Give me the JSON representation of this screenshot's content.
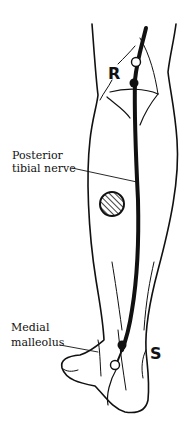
{
  "diagram": {
    "labels": {
      "nerve_line1": "Posterior",
      "nerve_line2": "tibial nerve",
      "malleolus_line1": "Medial",
      "malleolus_line2": "malleolus"
    },
    "markers": {
      "recording": "R",
      "stimulation": "S"
    },
    "colors": {
      "ink": "#111111",
      "background": "#ffffff"
    }
  }
}
